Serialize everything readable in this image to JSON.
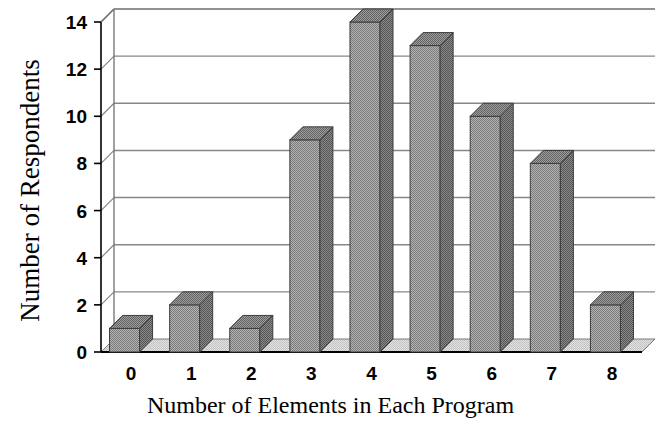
{
  "chart_data": {
    "type": "bar",
    "title": "",
    "subtitle": "",
    "xlabel": "Number of Elements in Each Program",
    "ylabel": "Number of Respondents",
    "categories": [
      "0",
      "1",
      "2",
      "3",
      "4",
      "5",
      "6",
      "7",
      "8"
    ],
    "values": [
      1,
      2,
      1,
      9,
      14,
      13,
      10,
      8,
      2
    ],
    "series": [
      {
        "name": "Respondents",
        "values": [
          1,
          2,
          1,
          9,
          14,
          13,
          10,
          8,
          2
        ]
      }
    ],
    "ylim": [
      0,
      14
    ],
    "ytick_values": [
      0,
      2,
      4,
      6,
      8,
      10,
      12,
      14
    ],
    "ytick_labels": [
      "0",
      "2",
      "4",
      "6",
      "8",
      "10",
      "12",
      "14"
    ],
    "xtick_labels": [
      "0",
      "1",
      "2",
      "3",
      "4",
      "5",
      "6",
      "7",
      "8"
    ],
    "grid": "horizontal",
    "legend": "none",
    "style": "3d-bar",
    "annotations": [],
    "colors": {
      "bar_front": "#9a9a9a",
      "bar_side": "#6e6e6e",
      "bar_top": "#7d7d7d",
      "floor": "#d9d9d9",
      "gridline": "#888888",
      "axis": "#000000",
      "background": "#ffffff",
      "text": "#000000"
    }
  }
}
